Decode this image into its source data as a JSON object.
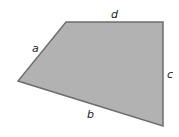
{
  "diagram": {
    "shape": "quadrilateral",
    "fill_color": "#b2b2b2",
    "stroke_color": "#6e6e6e",
    "label_color": "#222222",
    "sides": [
      {
        "id": "a",
        "label": "a"
      },
      {
        "id": "b",
        "label": "b"
      },
      {
        "id": "c",
        "label": "c"
      },
      {
        "id": "d",
        "label": "d"
      }
    ]
  }
}
